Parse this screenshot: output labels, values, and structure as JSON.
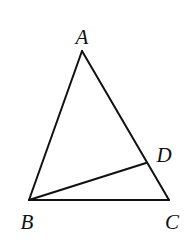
{
  "figure": {
    "type": "triangle-with-cevian",
    "points": {
      "A": {
        "label": "A",
        "x": 82,
        "y": 51,
        "label_x": 82,
        "label_y": 44
      },
      "B": {
        "label": "B",
        "x": 29,
        "y": 200,
        "label_x": 27,
        "label_y": 229
      },
      "C": {
        "label": "C",
        "x": 169,
        "y": 200,
        "label_x": 172,
        "label_y": 229
      },
      "D": {
        "label": "D",
        "x": 146,
        "y": 163,
        "label_x": 164,
        "label_y": 162
      }
    },
    "segments": [
      {
        "name": "AB",
        "from": "A",
        "to": "B"
      },
      {
        "name": "AC",
        "from": "A",
        "to": "C"
      },
      {
        "name": "BC",
        "from": "B",
        "to": "C"
      },
      {
        "name": "BD",
        "from": "B",
        "to": "D"
      }
    ],
    "stroke_color": "#111111"
  }
}
